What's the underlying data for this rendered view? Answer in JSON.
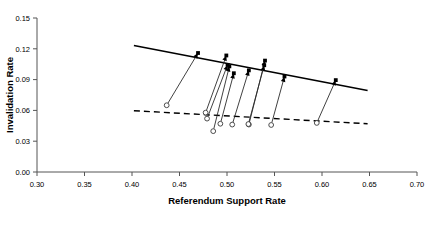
{
  "chart_data": {
    "type": "scatter",
    "title": "",
    "xlabel": "Referendum Support Rate",
    "ylabel": "Invalidation Rate",
    "xlim": [
      0.3,
      0.7
    ],
    "ylim": [
      0.0,
      0.15
    ],
    "xticks": [
      "0.30",
      "0.35",
      "0.40",
      "0.45",
      "0.50",
      "0.55",
      "0.60",
      "0.65",
      "0.70"
    ],
    "xtick_values": [
      0.3,
      0.35,
      0.4,
      0.45,
      0.5,
      0.55,
      0.6,
      0.65,
      0.7
    ],
    "yticks": [
      "0.00",
      "0.03",
      "0.06",
      "0.09",
      "0.12",
      "0.15"
    ],
    "ytick_values": [
      0.0,
      0.03,
      0.06,
      0.09,
      0.12,
      0.15
    ],
    "grid": false,
    "legend": "none",
    "series": [
      {
        "name": "Fitted line (observed)",
        "style": "solid",
        "x": [
          0.402,
          0.648
        ],
        "y": [
          0.1233,
          0.0793
        ]
      },
      {
        "name": "Fitted line (counterfactual)",
        "style": "dashed",
        "x": [
          0.402,
          0.648
        ],
        "y": [
          0.0597,
          0.047
        ]
      }
    ],
    "arrows": [
      {
        "x_start": 0.4365,
        "y_start": 0.065,
        "x_end": 0.4695,
        "y_end": 0.1159
      },
      {
        "x_start": 0.4775,
        "y_start": 0.0578,
        "x_end": 0.4993,
        "y_end": 0.1135
      },
      {
        "x_start": 0.479,
        "y_start": 0.052,
        "x_end": 0.5006,
        "y_end": 0.1043
      },
      {
        "x_start": 0.4855,
        "y_start": 0.0398,
        "x_end": 0.5025,
        "y_end": 0.1029
      },
      {
        "x_start": 0.493,
        "y_start": 0.047,
        "x_end": 0.5072,
        "y_end": 0.0962
      },
      {
        "x_start": 0.5055,
        "y_start": 0.0462,
        "x_end": 0.523,
        "y_end": 0.099
      },
      {
        "x_start": 0.523,
        "y_start": 0.0462,
        "x_end": 0.54,
        "y_end": 0.1085
      },
      {
        "x_start": 0.5225,
        "y_start": 0.0467,
        "x_end": 0.5392,
        "y_end": 0.104
      },
      {
        "x_start": 0.5465,
        "y_start": 0.0458,
        "x_end": 0.5605,
        "y_end": 0.093
      },
      {
        "x_start": 0.5945,
        "y_start": 0.0478,
        "x_end": 0.6145,
        "y_end": 0.0895
      }
    ],
    "marker_start": "open-circle",
    "marker_end": "filled-square-with-arrowhead"
  }
}
